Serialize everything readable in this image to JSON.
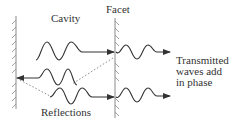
{
  "diagram": {
    "labels": {
      "cavity": "Cavity",
      "facet": "Facet",
      "reflections": "Reflections",
      "transmitted_line1": "Transmitted",
      "transmitted_line2": "waves add",
      "transmitted_line3": "in phase"
    },
    "elements": {
      "left_mirror": "hatched vertical mirror (left cavity end)",
      "facet": "hatched vertical facet (right cavity end, partially transmitting)",
      "waves": [
        {
          "name": "incident-wave-top",
          "direction": "right",
          "target": "facet"
        },
        {
          "name": "transmitted-wave-top",
          "direction": "right",
          "location": "outside facet"
        },
        {
          "name": "reflected-wave-middle",
          "direction": "left",
          "target": "left mirror"
        },
        {
          "name": "incident-wave-bottom",
          "direction": "right",
          "target": "facet"
        },
        {
          "name": "transmitted-wave-bottom",
          "direction": "right",
          "location": "outside facet"
        }
      ],
      "dotted_paths": [
        {
          "name": "reflection-path-facet-to-middle",
          "style": "dotted"
        },
        {
          "name": "reflection-path-mirror-to-bottom",
          "style": "dotted"
        }
      ]
    },
    "colors": {
      "stroke": "#333333",
      "hatch": "#8a8a8a",
      "dotted": "#8a8a8a",
      "background": "#ffffff"
    }
  }
}
